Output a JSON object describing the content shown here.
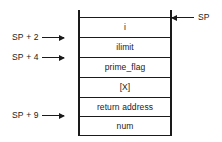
{
  "diagram": {
    "background_color": "#ffffff",
    "line_color": "#1a1a1a",
    "box": {
      "cells": [
        {
          "label": "",
          "name": "stack-cell-top-gap"
        },
        {
          "label": "i",
          "name": "stack-cell-i"
        },
        {
          "label": "ilimit",
          "name": "stack-cell-ilimit"
        },
        {
          "label": "prime_flag",
          "name": "stack-cell-prime-flag"
        },
        {
          "label": "[X]",
          "name": "stack-cell-x"
        },
        {
          "label": "return address",
          "name": "stack-cell-return-address"
        },
        {
          "label": "num",
          "name": "stack-cell-num"
        }
      ]
    },
    "left_pointers": [
      {
        "label": "SP + 2",
        "name": "pointer-sp-plus-2"
      },
      {
        "label": "SP + 4",
        "name": "pointer-sp-plus-4"
      },
      {
        "label": "SP + 9",
        "name": "pointer-sp-plus-9"
      }
    ],
    "right_pointers": [
      {
        "label": "SP",
        "name": "pointer-sp"
      }
    ]
  }
}
